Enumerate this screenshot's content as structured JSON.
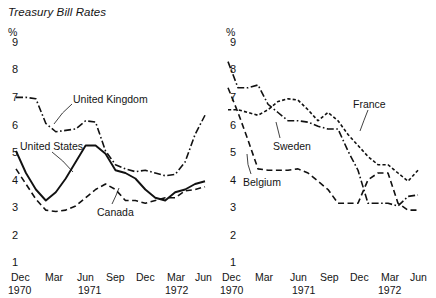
{
  "figure": {
    "title": "Treasury Bill Rates",
    "unit_symbol": "%",
    "y_ticks": [
      "9",
      "8",
      "7",
      "6",
      "5",
      "4",
      "3",
      "2",
      "1"
    ],
    "x_months": [
      "Dec",
      "Mar",
      "Jun",
      "Sep",
      "Dec",
      "Mar",
      "Jun"
    ],
    "x_years": [
      "1970",
      "1971",
      "1972"
    ]
  },
  "chart_data": [
    {
      "type": "line",
      "title": "Treasury Bill Rates",
      "panel": "left",
      "xlabel": "",
      "ylabel": "%",
      "ylim": [
        1,
        9
      ],
      "grid": false,
      "legend_position": "inline-annotations",
      "x_tick_labels": [
        "Dec 1970",
        "Mar 1971",
        "Jun 1971",
        "Sep 1971",
        "Dec 1971",
        "Mar 1972",
        "Jun 1972"
      ],
      "x": [
        "1970-12",
        "1971-01",
        "1971-02",
        "1971-03",
        "1971-04",
        "1971-05",
        "1971-06",
        "1971-07",
        "1971-08",
        "1971-09",
        "1971-10",
        "1971-11",
        "1971-12",
        "1972-01",
        "1972-02",
        "1972-03",
        "1972-04",
        "1972-05",
        "1972-06",
        "1972-07"
      ],
      "series": [
        {
          "name": "United States",
          "line_style": "solid",
          "values": [
            5.0,
            4.2,
            3.6,
            3.2,
            3.5,
            4.0,
            4.6,
            5.2,
            5.2,
            4.9,
            4.3,
            4.2,
            4.0,
            3.6,
            3.3,
            3.2,
            3.5,
            3.6,
            3.8,
            3.9
          ]
        },
        {
          "name": "United Kingdom",
          "line_style": "dash-dot",
          "values": [
            6.95,
            6.95,
            6.9,
            6.0,
            5.7,
            5.75,
            5.8,
            6.1,
            6.05,
            5.0,
            4.5,
            4.35,
            4.25,
            4.3,
            4.2,
            4.1,
            4.15,
            4.6,
            5.6,
            6.3
          ]
        },
        {
          "name": "Canada",
          "line_style": "dashed",
          "values": [
            4.35,
            3.8,
            3.25,
            2.85,
            2.8,
            2.85,
            3.0,
            3.3,
            3.6,
            3.8,
            3.6,
            3.2,
            3.2,
            3.1,
            3.2,
            3.3,
            3.3,
            3.55,
            3.6,
            3.7
          ]
        }
      ]
    },
    {
      "type": "line",
      "title": "Treasury Bill Rates",
      "panel": "right",
      "xlabel": "",
      "ylabel": "%",
      "ylim": [
        1,
        9
      ],
      "grid": false,
      "legend_position": "inline-annotations",
      "x_tick_labels": [
        "Dec 1970",
        "Mar 1971",
        "Jun 1971",
        "Sep 1971",
        "Dec 1971",
        "Mar 1972",
        "Jun 1972"
      ],
      "x": [
        "1970-12",
        "1971-01",
        "1971-02",
        "1971-03",
        "1971-04",
        "1971-05",
        "1971-06",
        "1971-07",
        "1971-08",
        "1971-09",
        "1971-10",
        "1971-11",
        "1971-12",
        "1972-01",
        "1972-02",
        "1972-03",
        "1972-04",
        "1972-05",
        "1972-06",
        "1972-07"
      ],
      "series": [
        {
          "name": "Sweden",
          "line_style": "dash-dot",
          "values": [
            8.25,
            7.3,
            7.3,
            7.4,
            6.7,
            6.4,
            6.1,
            6.1,
            6.05,
            5.9,
            5.8,
            5.8,
            5.0,
            4.3,
            3.1,
            3.1,
            3.1,
            3.0,
            3.35,
            3.4
          ]
        },
        {
          "name": "France",
          "line_style": "dotted-dash",
          "values": [
            6.5,
            6.5,
            6.4,
            6.3,
            6.5,
            6.8,
            6.9,
            6.85,
            6.5,
            6.1,
            6.4,
            6.1,
            5.6,
            5.2,
            4.8,
            4.5,
            4.5,
            4.2,
            3.9,
            4.3
          ]
        },
        {
          "name": "Belgium",
          "line_style": "dashed",
          "values": [
            7.3,
            6.4,
            5.4,
            4.35,
            4.3,
            4.3,
            4.3,
            4.35,
            4.2,
            3.9,
            3.6,
            3.1,
            3.1,
            3.1,
            3.95,
            4.2,
            4.2,
            3.1,
            2.85,
            2.85
          ]
        }
      ]
    }
  ],
  "labels": {
    "united_kingdom": "United Kingdom",
    "united_states": "United States",
    "canada": "Canada",
    "france": "France",
    "sweden": "Sweden",
    "belgium": "Belgium"
  }
}
